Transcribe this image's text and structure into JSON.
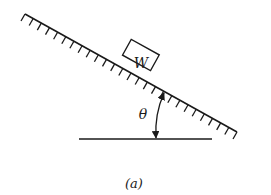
{
  "figure": {
    "caption": "(a)",
    "block_label": "W",
    "angle_label": "θ"
  },
  "geometry": {
    "incline": {
      "x1": 25,
      "y1": 14,
      "x2": 237,
      "y2": 132
    },
    "ground": {
      "x1": 79,
      "y1": 139,
      "x2": 212,
      "y2": 139
    },
    "angle_deg": 29
  },
  "colors": {
    "line": "#1a1a1a",
    "background": "#ffffff"
  }
}
